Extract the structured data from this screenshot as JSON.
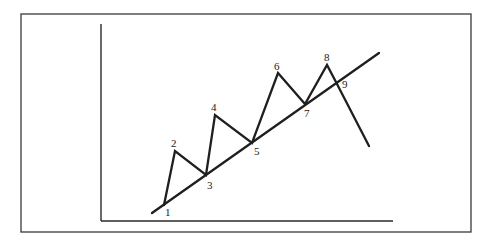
{
  "diagram": {
    "type": "trendline-wave-diagram",
    "colors": {
      "line": "#1f1f1f",
      "frame": "#3a3a3a",
      "background": "#ffffff"
    },
    "frame": {
      "x": 21,
      "y": 14,
      "width": 450,
      "height": 218
    },
    "axes": {
      "y_axis": {
        "x": 101,
        "y1": 24,
        "y2": 221
      },
      "x_axis": {
        "y": 221,
        "x1": 101,
        "x2": 393
      }
    },
    "trendline": {
      "x1": 152,
      "y1": 213,
      "x2": 379,
      "y2": 53
    },
    "price_path": [
      [
        164,
        205
      ],
      [
        175,
        151
      ],
      [
        206,
        175
      ],
      [
        215,
        115
      ],
      [
        252,
        143
      ],
      [
        278,
        73
      ],
      [
        305,
        104
      ],
      [
        327,
        65
      ],
      [
        337,
        84
      ],
      [
        369,
        146
      ]
    ],
    "points": [
      {
        "label": "1",
        "lx": 165,
        "ly": 216
      },
      {
        "label": "2",
        "lx": 171,
        "ly": 147
      },
      {
        "label": "3",
        "lx": 207,
        "ly": 189
      },
      {
        "label": "4",
        "lx": 211,
        "ly": 111
      },
      {
        "label": "5",
        "lx": 254,
        "ly": 155
      },
      {
        "label": "6",
        "lx": 274,
        "ly": 70
      },
      {
        "label": "7",
        "lx": 304,
        "ly": 117
      },
      {
        "label": "8",
        "lx": 324,
        "ly": 61
      },
      {
        "label": "9",
        "lx": 342,
        "ly": 88
      }
    ]
  }
}
